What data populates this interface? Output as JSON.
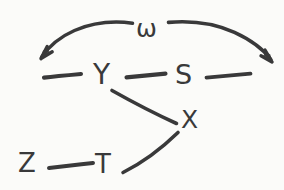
{
  "diagram": {
    "style": "hand-drawn pencil sketch on off-white paper",
    "ink_color": "#39393a",
    "background_color": "#fbfbf9",
    "nodes": [
      {
        "id": "omega",
        "label": "ω",
        "x": 147,
        "y": 30,
        "font_size": 25,
        "note": "greek lowercase omega, top center, arc label"
      },
      {
        "id": "Y",
        "label": "Y",
        "x": 104,
        "y": 77,
        "font_size": 27,
        "note": "middle row, left of center"
      },
      {
        "id": "S",
        "label": "S",
        "x": 186,
        "y": 76,
        "font_size": 25,
        "note": "middle row, right of center"
      },
      {
        "id": "X",
        "label": "X",
        "x": 190,
        "y": 121,
        "font_size": 24,
        "note": "lower middle right"
      },
      {
        "id": "Z",
        "label": "Z",
        "x": 28,
        "y": 164,
        "font_size": 25,
        "note": "bottom left"
      },
      {
        "id": "T",
        "label": "T",
        "x": 105,
        "y": 166,
        "font_size": 25,
        "note": "bottom, right of Z"
      }
    ],
    "edges": [
      {
        "id": "dash-left-to-Y",
        "kind": "dash",
        "from": "left-margin",
        "to": "Y",
        "note": "short horizontal dash left of Y"
      },
      {
        "id": "dash-Y-to-S",
        "kind": "dash",
        "from": "Y",
        "to": "S",
        "note": "horizontal dash between Y and S"
      },
      {
        "id": "dash-S-to-right",
        "kind": "dash",
        "from": "S",
        "to": "right-margin",
        "note": "horizontal dash right of S"
      },
      {
        "id": "arc-omega-left",
        "kind": "arrow",
        "from": "omega",
        "to": "left-margin",
        "note": "curved arc sweeping left, arrowhead down-left"
      },
      {
        "id": "arc-omega-right",
        "kind": "arrow",
        "from": "omega",
        "to": "right-margin",
        "note": "curved arc sweeping right, arrowhead down-right"
      },
      {
        "id": "line-Y-to-X",
        "kind": "line",
        "from": "Y",
        "to": "X",
        "note": "diagonal descending from Y down-right to X"
      },
      {
        "id": "line-T-to-X",
        "kind": "line",
        "from": "T",
        "to": "X",
        "note": "diagonal ascending from right of T up-right to X"
      },
      {
        "id": "dash-Z-to-T",
        "kind": "dash",
        "from": "Z",
        "to": "T",
        "note": "horizontal dash between Z and T"
      }
    ]
  }
}
